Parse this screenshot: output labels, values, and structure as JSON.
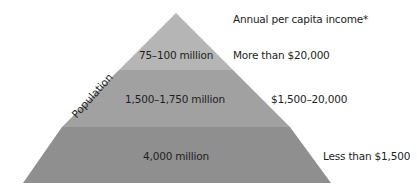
{
  "diagram": {
    "type": "pyramid",
    "axis_label": "Population",
    "right_header": "Annual per capita income*",
    "tiers": [
      {
        "population": "75–100 million",
        "income": "More than $20,000",
        "color": "#b5b5b5"
      },
      {
        "population": "1,500–1,750 million",
        "income": "$1,500–20,000",
        "color": "#a1a1a1"
      },
      {
        "population": "4,000 million",
        "income": "Less than $1,500",
        "color": "#8f8f8f"
      }
    ]
  }
}
